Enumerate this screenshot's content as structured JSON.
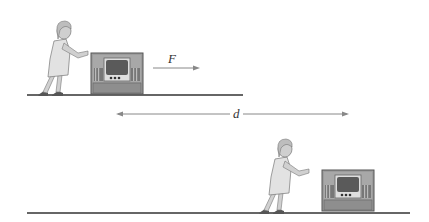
{
  "figure": {
    "top_scene": {
      "force_label": "F",
      "description": "Woman pushing TV cabinet with force F"
    },
    "displacement": {
      "label": "d"
    },
    "bottom_scene": {
      "description": "Woman and TV cabinet after moving distance d"
    },
    "colors": {
      "line": "#333333",
      "arrow": "#888888",
      "cabinet": "#9a9a9a",
      "cabinet_dark": "#6e6e6e",
      "screen": "#5c5c5c",
      "dress": "#dcdcdc",
      "skin": "#c8c8c8"
    }
  }
}
